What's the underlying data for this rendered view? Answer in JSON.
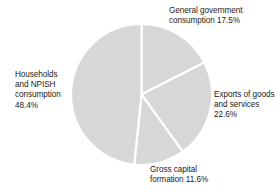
{
  "chart_data": {
    "type": "pie",
    "title": "",
    "subtitle": "",
    "xlabel": "",
    "ylabel": "",
    "legend_position": "none",
    "grid": false,
    "units": "percent",
    "start_angle_deg": 0,
    "direction": "clockwise",
    "categories": [
      "General government consumption",
      "Exports of goods and services",
      "Gross capital formation",
      "Households and NPISH consumption"
    ],
    "values": [
      17.5,
      22.6,
      11.6,
      48.4
    ],
    "slice_color": "#d7d7d7",
    "slice_border_color": "#ffffff",
    "slices": [
      {
        "name": "general-government-consumption",
        "value": 17.5,
        "value_text": "17.5%",
        "label_lines": "General government\nconsumption 17.5%",
        "start_deg": 0,
        "end_deg": 63.0
      },
      {
        "name": "exports-of-goods-and-services",
        "value": 22.6,
        "value_text": "22.6%",
        "label_lines": "Exports of goods\nand services\n22.6%",
        "start_deg": 63.0,
        "end_deg": 144.4
      },
      {
        "name": "gross-capital-formation",
        "value": 11.6,
        "value_text": "11.6%",
        "label_lines": "Gross capital\nformation 11.6%",
        "start_deg": 144.4,
        "end_deg": 186.1
      },
      {
        "name": "households-and-npish-consumption",
        "value": 48.4,
        "value_text": "48.4%",
        "label_lines": "Households\nand NPISH\nconsumption\n48.4%",
        "start_deg": 186.1,
        "end_deg": 360.0
      }
    ]
  },
  "labels": {
    "government": "General government\nconsumption 17.5%",
    "exports": "Exports of goods\nand services\n22.6%",
    "gross_capital": "Gross capital\nformation 11.6%",
    "households": "Households\nand NPISH\nconsumption\n48.4%"
  }
}
